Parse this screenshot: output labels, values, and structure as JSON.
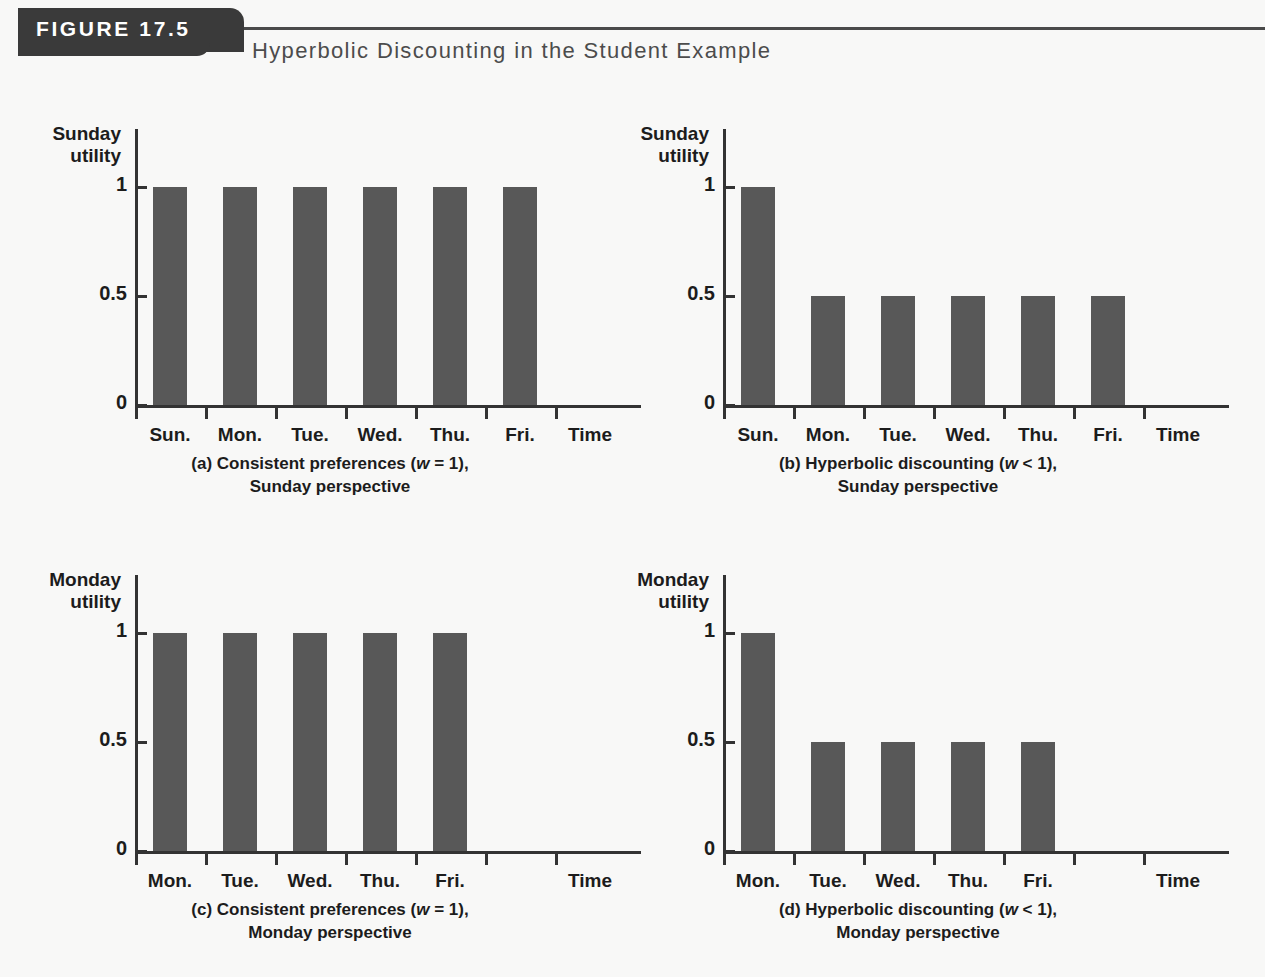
{
  "figure": {
    "banner_label": "FIGURE 17.5",
    "title": "Hyperbolic Discounting in the Student Example",
    "banner_color": "#3a3a3a",
    "bar_color": "#585858",
    "axis_color": "#333333",
    "background": "#f8f8f7"
  },
  "chart_data": [
    {
      "type": "bar",
      "panel_id": "a",
      "caption_line1_pre": "(a) Consistent preferences (",
      "caption_line1_var": "w",
      "caption_line1_post": " = 1),",
      "caption_line2": "Sunday perspective",
      "ylabel": "Sunday\nutility",
      "ylabel_line1": "Sunday",
      "ylabel_line2": "utility",
      "xlabel": "Time",
      "categories": [
        "Sun.",
        "Mon.",
        "Tue.",
        "Wed.",
        "Thu.",
        "Fri."
      ],
      "values": [
        1,
        1,
        1,
        1,
        1,
        1
      ],
      "yticks": [
        "0",
        "0.5",
        "1"
      ],
      "ytick_values": [
        0,
        0.5,
        1
      ],
      "ylim": [
        0,
        1.15
      ],
      "grid": false,
      "legend": "none"
    },
    {
      "type": "bar",
      "panel_id": "b",
      "caption_line1_pre": "(b) Hyperbolic discounting (",
      "caption_line1_var": "w",
      "caption_line1_post": " < 1),",
      "caption_line2": "Sunday perspective",
      "ylabel_line1": "Sunday",
      "ylabel_line2": "utility",
      "xlabel": "Time",
      "categories": [
        "Sun.",
        "Mon.",
        "Tue.",
        "Wed.",
        "Thu.",
        "Fri."
      ],
      "values": [
        1,
        0.5,
        0.5,
        0.5,
        0.5,
        0.5
      ],
      "yticks": [
        "0",
        "0.5",
        "1"
      ],
      "ytick_values": [
        0,
        0.5,
        1
      ],
      "ylim": [
        0,
        1.15
      ],
      "grid": false,
      "legend": "none"
    },
    {
      "type": "bar",
      "panel_id": "c",
      "caption_line1_pre": "(c) Consistent preferences (",
      "caption_line1_var": "w",
      "caption_line1_post": " = 1),",
      "caption_line2": "Monday perspective",
      "ylabel_line1": "Monday",
      "ylabel_line2": "utility",
      "xlabel": "Time",
      "categories": [
        "Mon.",
        "Tue.",
        "Wed.",
        "Thu.",
        "Fri."
      ],
      "values": [
        1,
        1,
        1,
        1,
        1
      ],
      "yticks": [
        "0",
        "0.5",
        "1"
      ],
      "ytick_values": [
        0,
        0.5,
        1
      ],
      "ylim": [
        0,
        1.15
      ],
      "grid": false,
      "legend": "none"
    },
    {
      "type": "bar",
      "panel_id": "d",
      "caption_line1_pre": "(d) Hyperbolic discounting (",
      "caption_line1_var": "w",
      "caption_line1_post": " < 1),",
      "caption_line2": "Monday perspective",
      "ylabel_line1": "Monday",
      "ylabel_line2": "utility",
      "xlabel": "Time",
      "categories": [
        "Mon.",
        "Tue.",
        "Wed.",
        "Thu.",
        "Fri."
      ],
      "values": [
        1,
        0.5,
        0.5,
        0.5,
        0.5
      ],
      "yticks": [
        "0",
        "0.5",
        "1"
      ],
      "ytick_values": [
        0,
        0.5,
        1
      ],
      "ylim": [
        0,
        1.15
      ],
      "grid": false,
      "legend": "none"
    }
  ]
}
